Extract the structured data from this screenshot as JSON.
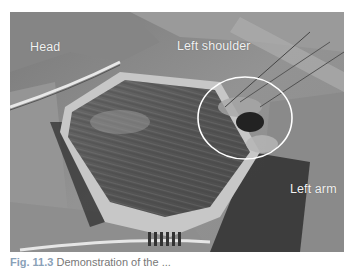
{
  "figure": {
    "type": "grayscale intraoperative photograph",
    "labels": {
      "head": "Head",
      "shoulder": "Left shoulder",
      "arm": "Left arm"
    },
    "annotation": {
      "shape": "ellipse",
      "color": "#ffffff",
      "center": [
        245,
        118
      ],
      "radii": [
        47,
        41
      ]
    }
  },
  "caption": {
    "number": "Fig. 11.3",
    "text": "Demonstration of the ..."
  }
}
